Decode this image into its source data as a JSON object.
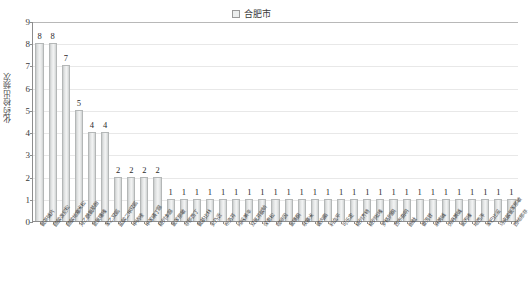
{
  "legend": {
    "marker": "legend-square-icon",
    "label": "合肥市"
  },
  "axis": {
    "ylabel": "化药检出频次",
    "yticks": [
      "0",
      "1",
      "2",
      "3",
      "4",
      "5",
      "6",
      "7",
      "8",
      "9"
    ]
  },
  "chart_data": {
    "type": "bar",
    "title": "",
    "xlabel": "",
    "ylabel": "化药检出频次",
    "ylim": [
      0,
      9
    ],
    "grid": true,
    "legend_position": "top-center",
    "series": [
      {
        "name": "合肥市",
        "values": [
          8,
          8,
          7,
          5,
          4,
          4,
          2,
          2,
          2,
          2,
          1,
          1,
          1,
          1,
          1,
          1,
          1,
          1,
          1,
          1,
          1,
          1,
          1,
          1,
          1,
          1,
          1,
          1,
          1,
          1,
          1,
          1,
          1,
          1,
          1,
          1,
          1
        ]
      }
    ],
    "categories": [
      "氨茶碱片",
      "醋酸泼尼松",
      "醋酸地塞米松",
      "对乙酰氨基酚",
      "氢氯噻嗪",
      "苯乙双胍",
      "盐酸二甲双胍",
      "甲硝唑",
      "甲苯磺丁脲",
      "格列本脲",
      "氯苯那敏",
      "非那西丁",
      "氨基比林",
      "安乃近",
      "布洛芬",
      "吲哚美辛",
      "双氯芬酸钠",
      "保泰松",
      "咖啡因",
      "氯噻酮",
      "呋塞米",
      "螺内酯",
      "利血平",
      "可乐定",
      "格列齐特",
      "格列吡嗪",
      "罗格列酮",
      "西布曲明",
      "酚酞",
      "番泻苷",
      "麻黄碱",
      "伪麻黄碱",
      "氯丙嗪",
      "地西泮",
      "苯巴比妥",
      "马来酸氯苯那敏",
      "西地那非"
    ]
  }
}
